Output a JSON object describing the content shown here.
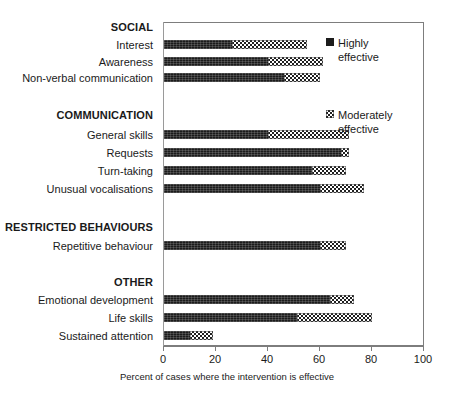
{
  "chart_data": {
    "type": "bar",
    "orientation": "horizontal",
    "stacked": true,
    "title": "",
    "xlabel": "Percent of cases where the intervention is effective",
    "ylabel": "",
    "xlim": [
      0,
      100
    ],
    "xticks": [
      0,
      20,
      40,
      60,
      80,
      100
    ],
    "grid": false,
    "legend_position": "inside-right",
    "series": [
      {
        "name": "Highly effective",
        "pattern": "solid-dark",
        "color": "#1c1c1c",
        "values": [
          26,
          40,
          46,
          40,
          68,
          57,
          60,
          60,
          64,
          51,
          10
        ]
      },
      {
        "name": "Moderately effective",
        "pattern": "checkerboard",
        "color": "#ffffff",
        "values": [
          29,
          21,
          14,
          31,
          3,
          13,
          17,
          10,
          9,
          29,
          9
        ]
      }
    ],
    "categories": [
      "Interest",
      "Awareness",
      "Non-verbal communication",
      "General skills",
      "Requests",
      "Turn-taking",
      "Unusual vocalisations",
      "Repetitive  behaviour",
      "Emotional development",
      "Life skills",
      "Sustained attention"
    ],
    "totals": [
      55,
      61,
      60,
      71,
      71,
      70,
      77,
      70,
      73,
      80,
      19
    ],
    "groups": [
      {
        "name": "SOCIAL",
        "categories": [
          "Interest",
          "Awareness",
          "Non-verbal communication"
        ]
      },
      {
        "name": "COMMUNICATION",
        "categories": [
          "General skills",
          "Requests",
          "Turn-taking",
          "Unusual vocalisations"
        ]
      },
      {
        "name": "RESTRICTED BEHAVIOURS",
        "categories": [
          "Repetitive  behaviour"
        ]
      },
      {
        "name": "OTHER",
        "categories": [
          "Emotional development",
          "Life skills",
          "Sustained attention"
        ]
      }
    ]
  },
  "axis": {
    "tick_labels": [
      "0",
      "20",
      "40",
      "60",
      "80",
      "100"
    ],
    "title": "Percent of cases where the intervention is effective"
  },
  "legend": {
    "items": [
      {
        "label_line1": "Highly",
        "label_line2": "effective",
        "swatch": "solid-dark-square"
      },
      {
        "label_line1": "Moderately",
        "label_line2": "effective",
        "swatch": "checkered-square"
      }
    ]
  },
  "rows": [
    {
      "label": "SOCIAL",
      "kind": "group"
    },
    {
      "label": "Interest",
      "kind": "bar",
      "high": 26,
      "moderate": 29
    },
    {
      "label": "Awareness",
      "kind": "bar",
      "high": 40,
      "moderate": 21
    },
    {
      "label": "Non-verbal communication",
      "kind": "bar",
      "high": 46,
      "moderate": 14
    },
    {
      "label": "COMMUNICATION",
      "kind": "group"
    },
    {
      "label": "General skills",
      "kind": "bar",
      "high": 40,
      "moderate": 31
    },
    {
      "label": "Requests",
      "kind": "bar",
      "high": 68,
      "moderate": 3
    },
    {
      "label": "Turn-taking",
      "kind": "bar",
      "high": 57,
      "moderate": 13
    },
    {
      "label": "Unusual vocalisations",
      "kind": "bar",
      "high": 60,
      "moderate": 17
    },
    {
      "label": "RESTRICTED BEHAVIOURS",
      "kind": "group"
    },
    {
      "label": "Repetitive  behaviour",
      "kind": "bar",
      "high": 60,
      "moderate": 10
    },
    {
      "label": "OTHER",
      "kind": "group"
    },
    {
      "label": "Emotional development",
      "kind": "bar",
      "high": 64,
      "moderate": 9
    },
    {
      "label": "Life skills",
      "kind": "bar",
      "high": 51,
      "moderate": 29
    },
    {
      "label": "Sustained attention",
      "kind": "bar",
      "high": 10,
      "moderate": 9
    }
  ]
}
